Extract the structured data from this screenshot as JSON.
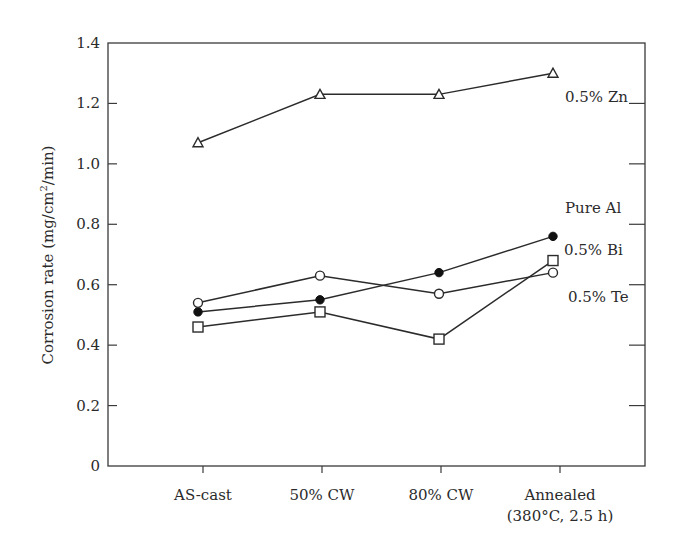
{
  "chart_data": {
    "type": "line",
    "title": "",
    "xlabel": "",
    "ylabel": "Corrosion rate (mg/cm²/min)",
    "ylabel_parts": {
      "main": "Corrosion rate (mg/cm",
      "sup": "2",
      "tail": "/min)"
    },
    "categories": [
      "AS-cast",
      "50% CW",
      "80% CW",
      "Annealed (380°C, 2.5 h)"
    ],
    "category_labels": [
      [
        "AS-cast"
      ],
      [
        "50% CW"
      ],
      [
        "80% CW"
      ],
      [
        "Annealed",
        "(380°C, 2.5 h)"
      ]
    ],
    "ylim": [
      0,
      1.4
    ],
    "yticks": [
      0,
      0.2,
      0.4,
      0.6,
      0.8,
      1.0,
      1.2,
      1.4
    ],
    "ytick_labels": [
      "0",
      "0.2",
      "0.4",
      "0.6",
      "0.8",
      "1.0",
      "1.2",
      "1.4"
    ],
    "grid": false,
    "legend": "inline labels at right end of each series",
    "series": [
      {
        "name": "0.5% Zn",
        "marker": "open-triangle",
        "values": [
          1.07,
          1.23,
          1.23,
          1.3
        ]
      },
      {
        "name": "Pure Al",
        "marker": "filled-circle",
        "values": [
          0.51,
          0.55,
          0.64,
          0.76
        ]
      },
      {
        "name": "0.5% Bi",
        "marker": "open-square",
        "values": [
          0.46,
          0.51,
          0.42,
          0.68
        ]
      },
      {
        "name": "0.5% Te",
        "marker": "open-circle",
        "values": [
          0.54,
          0.63,
          0.57,
          0.64
        ]
      }
    ]
  },
  "labels": {
    "zn": "0.5% Zn",
    "al": "Pure Al",
    "bi": "0.5% Bi",
    "te": "0.5% Te"
  },
  "colors": {
    "line": "#2b2b2b",
    "axis": "#3a3a3a"
  }
}
